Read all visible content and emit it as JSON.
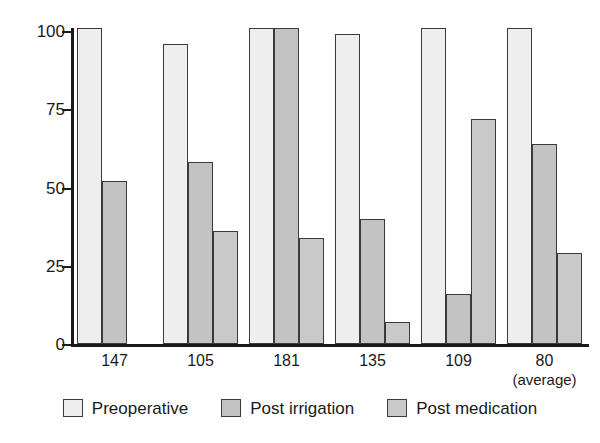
{
  "chart_data": {
    "type": "bar",
    "title": "",
    "xlabel": "",
    "ylabel": "Percent bacteria-free canals",
    "ylim": [
      0,
      100
    ],
    "yticks": [
      0,
      25,
      50,
      75,
      100
    ],
    "ytick_labels": [
      "0",
      "25",
      "50",
      "75",
      "100"
    ],
    "grid": false,
    "legend_position": "bottom",
    "categories": [
      "147",
      "105",
      "181",
      "135",
      "109",
      "80"
    ],
    "category_sublabels": [
      "",
      "",
      "",
      "",
      "",
      "(average)"
    ],
    "series": [
      {
        "name": "Preoperative",
        "color": "#eeeeee",
        "values": [
          101,
          96,
          101,
          99,
          101,
          101
        ]
      },
      {
        "name": "Post irrigation",
        "color": "#c3c3c3",
        "values": [
          52,
          58,
          101,
          40,
          16,
          64
        ]
      },
      {
        "name": "Post medication",
        "color": "#c9c9c9",
        "values": [
          null,
          36,
          34,
          7,
          72,
          29
        ]
      }
    ]
  },
  "legend": {
    "items": [
      {
        "label": "Preoperative",
        "swatch": "legend-swatch-preoperative"
      },
      {
        "label": "Post irrigation",
        "swatch": "legend-swatch-post-irrigation"
      },
      {
        "label": "Post medication",
        "swatch": "legend-swatch-post-medication"
      }
    ]
  }
}
